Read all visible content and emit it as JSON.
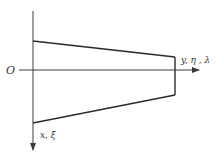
{
  "diagram": {
    "origin_label": "O",
    "horizontal_axis_label": "y, η , λ",
    "vertical_axis_label": "x, ξ",
    "colors": {
      "stroke": "#2a2a2a",
      "axis": "#3a3a3a",
      "text": "#333333",
      "background": "#ffffff"
    },
    "shape": "trapezoid",
    "trapezoid_points": [
      [
        33,
        41
      ],
      [
        175,
        57
      ],
      [
        175,
        95
      ],
      [
        33,
        123
      ]
    ]
  }
}
